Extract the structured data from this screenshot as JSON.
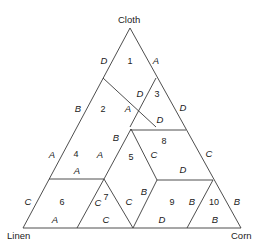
{
  "vertices": {
    "top": "Cloth",
    "left": "Linen",
    "right": "Corn"
  },
  "regions": [
    {
      "id": "1",
      "label": "1"
    },
    {
      "id": "2",
      "label": "2"
    },
    {
      "id": "3",
      "label": "3"
    },
    {
      "id": "4",
      "label": "4"
    },
    {
      "id": "5",
      "label": "5"
    },
    {
      "id": "6",
      "label": "6"
    },
    {
      "id": "7",
      "label": "7"
    },
    {
      "id": "8",
      "label": "8"
    },
    {
      "id": "9",
      "label": "9"
    },
    {
      "id": "10",
      "label": "10"
    }
  ],
  "edge_labels": [
    {
      "id": "r1-left",
      "label": "D"
    },
    {
      "id": "r1-right",
      "label": "A"
    },
    {
      "id": "r2-left",
      "label": "B"
    },
    {
      "id": "r2-right",
      "label": "A"
    },
    {
      "id": "r3-left",
      "label": "D"
    },
    {
      "id": "r3-right",
      "label": "D"
    },
    {
      "id": "r3-bottom",
      "label": "D"
    },
    {
      "id": "r4-left",
      "label": "A"
    },
    {
      "id": "r4-right",
      "label": "A"
    },
    {
      "id": "r4-bottom",
      "label": "A"
    },
    {
      "id": "r5-topleft",
      "label": "B"
    },
    {
      "id": "r5-right",
      "label": "C"
    },
    {
      "id": "r5-bottomright",
      "label": "B"
    },
    {
      "id": "r5-bottomleft",
      "label": "C"
    },
    {
      "id": "r6-left",
      "label": "C"
    },
    {
      "id": "r6-bottom",
      "label": "A"
    },
    {
      "id": "r7-left",
      "label": "C"
    },
    {
      "id": "r7-bottom",
      "label": "C"
    },
    {
      "id": "r8-right",
      "label": "C"
    },
    {
      "id": "r8-bottom",
      "label": "D"
    },
    {
      "id": "r9-bottom",
      "label": "D"
    },
    {
      "id": "r9-right",
      "label": "B"
    },
    {
      "id": "r10-right",
      "label": "B"
    },
    {
      "id": "r10-bottom",
      "label": "B"
    }
  ]
}
